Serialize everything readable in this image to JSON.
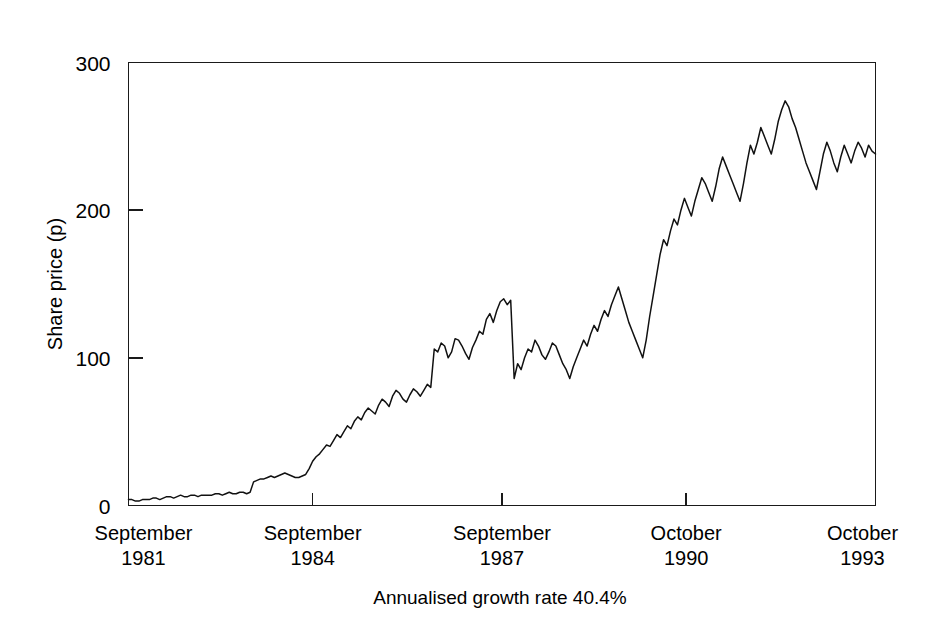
{
  "chart_data": {
    "type": "line",
    "title": "",
    "subtitle": "",
    "caption": "Annualised growth rate 40.4%",
    "xlabel": "",
    "ylabel": "Share price (p)",
    "ylim": [
      0,
      300
    ],
    "yticks": [
      0,
      100,
      200,
      300
    ],
    "ytick_labels": [
      "0",
      "100",
      "200",
      "300"
    ],
    "grid": false,
    "legend": null,
    "legend_position": "none",
    "xlim": [
      0,
      146
    ],
    "xtick_positions": [
      0,
      36,
      73,
      109,
      146
    ],
    "xtick_labels": [
      {
        "month": "September",
        "year": "1981"
      },
      {
        "month": "September",
        "year": "1984"
      },
      {
        "month": "September",
        "year": "1987"
      },
      {
        "month": "October",
        "year": "1990"
      },
      {
        "month": "October",
        "year": "1993"
      }
    ],
    "series": [
      {
        "name": "Share price",
        "color": "#111111",
        "x_unit": "months since September 1981",
        "values": [
          4,
          4,
          3,
          3,
          4,
          4,
          4,
          5,
          5,
          4,
          5,
          6,
          6,
          5,
          6,
          7,
          6,
          6,
          7,
          7,
          6,
          7,
          7,
          7,
          7,
          8,
          8,
          7,
          8,
          9,
          8,
          8,
          9,
          9,
          8,
          9,
          16,
          17,
          18,
          18,
          19,
          20,
          19,
          20,
          21,
          22,
          21,
          20,
          19,
          19,
          20,
          21,
          25,
          30,
          33,
          35,
          38,
          41,
          40,
          44,
          48,
          46,
          50,
          54,
          52,
          57,
          60,
          58,
          63,
          66,
          64,
          62,
          68,
          72,
          70,
          67,
          74,
          78,
          76,
          72,
          70,
          75,
          79,
          77,
          74,
          78,
          82,
          80,
          106,
          104,
          110,
          108,
          100,
          104,
          113,
          112,
          108,
          103,
          99,
          107,
          112,
          118,
          116,
          126,
          130,
          124,
          132,
          138,
          140,
          136,
          139,
          86,
          96,
          92,
          100,
          106,
          104,
          112,
          108,
          102,
          99,
          104,
          110,
          108,
          102,
          96,
          92,
          86,
          94,
          100,
          106,
          112,
          108,
          116,
          122,
          118,
          126,
          132,
          128,
          136,
          142,
          148,
          140,
          132,
          124,
          118,
          112,
          106,
          100,
          112,
          128,
          142,
          156,
          170,
          180,
          176,
          186,
          194,
          190,
          200,
          208,
          202,
          196,
          206,
          214,
          222,
          218,
          212,
          206,
          216,
          228,
          236,
          230,
          224,
          218,
          212,
          206,
          218,
          232,
          244,
          238,
          246,
          256,
          250,
          244,
          238,
          248,
          260,
          268,
          274,
          270,
          262,
          256,
          248,
          240,
          232,
          226,
          220,
          214,
          226,
          238,
          246,
          240,
          232,
          226,
          236,
          244,
          238,
          232,
          240,
          246,
          242,
          236,
          244,
          240,
          238
        ]
      }
    ]
  },
  "axes": {
    "y_axis_title": "Share price (p)"
  }
}
